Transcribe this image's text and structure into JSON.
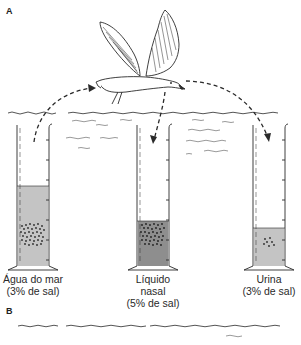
{
  "panels": {
    "a": {
      "label": "A"
    },
    "b": {
      "label": "B"
    }
  },
  "cylinders": [
    {
      "id": "seawater",
      "line1": "Água do mar",
      "line2": "(3% de sal)",
      "line3": "",
      "fill_color": "#c4c4c4",
      "fill_level_y": 186
    },
    {
      "id": "nasal",
      "line1": "Líquido",
      "line2": "nasal",
      "line3": "(5% de sal)",
      "fill_color": "#8e8e8e",
      "fill_level_y": 221
    },
    {
      "id": "urine",
      "line1": "Urina",
      "line2": "(3% de sal)",
      "line3": "",
      "fill_color": "#c4c4c4",
      "fill_level_y": 228
    }
  ],
  "colors": {
    "ink": "#2a2a2a",
    "light_liquid": "#c4c4c4",
    "dark_liquid": "#8e8e8e",
    "background": "#ffffff"
  }
}
